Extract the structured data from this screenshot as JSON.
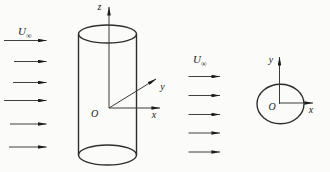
{
  "figure": {
    "colors": {
      "background": "#fbfbf9",
      "line": "#3a3a3a",
      "arrowhead": "#1c1c1c"
    },
    "left_flow": {
      "label_symbol": "U",
      "label_subscript": "∞",
      "arrows": [
        {
          "x1": 4,
          "x2": 46.5,
          "y": 40.5
        },
        {
          "x1": 14,
          "x2": 46.5,
          "y": 61.5
        },
        {
          "x1": 13,
          "x2": 46.5,
          "y": 82.5
        },
        {
          "x1": 4,
          "x2": 46.5,
          "y": 100.5
        },
        {
          "x1": 10,
          "x2": 46.5,
          "y": 124
        },
        {
          "x1": 9,
          "x2": 46.5,
          "y": 147
        }
      ]
    },
    "cylinder_diagram": {
      "z_label": "z",
      "y_label": "y",
      "x_label": "x",
      "origin_label": "O"
    },
    "middle_flow": {
      "label_symbol": "U",
      "label_subscript": "∞",
      "arrows": [
        {
          "x1": 188.5,
          "x2": 220,
          "y": 76.5
        },
        {
          "x1": 188.5,
          "x2": 220,
          "y": 95.5
        },
        {
          "x1": 188.5,
          "x2": 220,
          "y": 114.5
        },
        {
          "x1": 188.5,
          "x2": 220,
          "y": 133
        },
        {
          "x1": 188.5,
          "x2": 220,
          "y": 152
        }
      ]
    },
    "circle_diagram": {
      "y_label": "y",
      "x_label": "x",
      "origin_label": "O"
    }
  }
}
